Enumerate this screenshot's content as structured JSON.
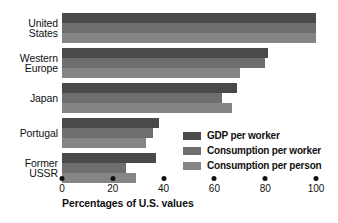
{
  "chart_data": {
    "type": "bar",
    "orientation": "horizontal",
    "title": "",
    "xlabel": "Percentages of U.S. values",
    "ylabel": "",
    "xlim": [
      0,
      100
    ],
    "xticks": [
      0,
      20,
      40,
      60,
      80,
      100
    ],
    "xtick_labels": [
      "0",
      "20",
      "40",
      "60",
      "80",
      "100"
    ],
    "grid": false,
    "legend_position": "inside-lower-right",
    "categories": [
      "United States",
      "Western Europe",
      "Japan",
      "Portugal",
      "Former USSR"
    ],
    "category_lines": [
      [
        "United",
        "States"
      ],
      [
        "Western",
        "Europe"
      ],
      [
        "Japan"
      ],
      [
        "Portugal"
      ],
      [
        "Former",
        "USSR"
      ]
    ],
    "series": [
      {
        "name": "GDP per worker",
        "color": "#4a4a4a",
        "values": [
          100,
          81,
          69,
          38,
          37
        ]
      },
      {
        "name": "Consumption per worker",
        "color": "#6e6e6e",
        "values": [
          100,
          80,
          63,
          36,
          25
        ]
      },
      {
        "name": "Consumption per person",
        "color": "#858585",
        "values": [
          100,
          70,
          67,
          33,
          29
        ]
      }
    ]
  },
  "colors": {
    "gdp_per_worker": "#4a4a4a",
    "consumption_per_worker": "#6e6e6e",
    "consumption_per_person": "#858585",
    "text": "#111111",
    "background": "#ffffff"
  }
}
